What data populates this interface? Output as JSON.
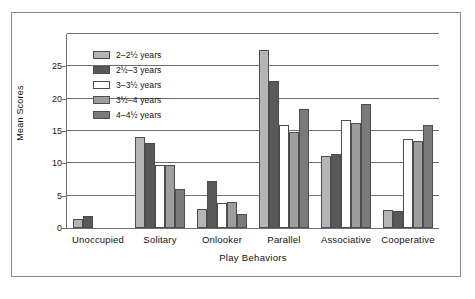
{
  "chart_data": {
    "type": "bar",
    "title": "",
    "xlabel": "Play Behaviors",
    "ylabel": "Mean Scores",
    "categories": [
      "Unoccupied",
      "Solitary",
      "Onlooker",
      "Parallel",
      "Associative",
      "Cooperative"
    ],
    "ylim": [
      0,
      30
    ],
    "yticks": [
      0,
      5,
      10,
      15,
      20,
      25
    ],
    "ytick_labels": [
      "0",
      "5",
      "10",
      "15",
      "20",
      "25"
    ],
    "grid": true,
    "grid_axis": "y",
    "legend_position": "upper-left-inset",
    "series": [
      {
        "name": "2–2½ years",
        "color": "#b5b5b5",
        "values": [
          1.4,
          14.1,
          2.9,
          27.6,
          11.1,
          2.8
        ]
      },
      {
        "name": "2½–3 years",
        "color": "#595959",
        "values": [
          1.8,
          13.2,
          7.3,
          22.8,
          11.5,
          2.6
        ]
      },
      {
        "name": "3–3½ years",
        "color": "#ffffff",
        "values": [
          0,
          9.7,
          3.9,
          15.9,
          16.7,
          13.8
        ]
      },
      {
        "name": "3½–4 years",
        "color": "#9e9e9e",
        "values": [
          0,
          9.8,
          4.1,
          14.8,
          16.3,
          13.4
        ]
      },
      {
        "name": "4–4½ years",
        "color": "#7a7a7a",
        "values": [
          0,
          6.1,
          2.1,
          18.4,
          19.2,
          15.9
        ]
      }
    ]
  },
  "axis": {
    "y_title": "Mean Scores",
    "x_title": "Play Behaviors"
  }
}
